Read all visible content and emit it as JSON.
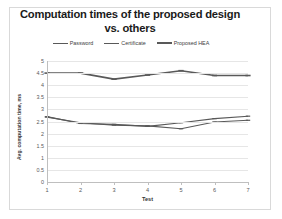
{
  "chart_data": {
    "type": "line",
    "title": "Computation times of the proposed design vs. others",
    "title_line1": "Computation times of the proposed design",
    "title_line2": "vs. others",
    "xlabel": "Test",
    "ylabel": "Avg. computation time, ms",
    "x": [
      1,
      2,
      3,
      4,
      5,
      6,
      7
    ],
    "categories": [
      "1",
      "2",
      "3",
      "4",
      "5",
      "6",
      "7"
    ],
    "xticklabels": [
      "1",
      "2",
      "3",
      "4",
      "5",
      "6",
      "7"
    ],
    "yticklabels": [
      "0",
      "0.5",
      "1",
      "1.5",
      "2",
      "2.5",
      "3",
      "3.5",
      "4",
      "4.5",
      "5"
    ],
    "ytickvalues": [
      0,
      0.5,
      1,
      1.5,
      2,
      2.5,
      3,
      3.5,
      4,
      4.5,
      5
    ],
    "ylim": [
      0,
      5
    ],
    "xlim": [
      1,
      7
    ],
    "grid": "horizontal",
    "legend_position": "top-center",
    "series": [
      {
        "name": "Password",
        "color": "#595959",
        "marker": "dash",
        "line_width": 1.1,
        "values": [
          2.68,
          2.45,
          2.35,
          2.32,
          2.2,
          2.48,
          2.55
        ]
      },
      {
        "name": "Certificate",
        "color": "#595959",
        "marker": "dash",
        "line_width": 1.1,
        "values": [
          2.7,
          2.42,
          2.38,
          2.3,
          2.45,
          2.62,
          2.72
        ]
      },
      {
        "name": "Proposed HEA",
        "color": "#595959",
        "marker": "dash",
        "line_width": 1.6,
        "values": [
          4.5,
          4.5,
          4.25,
          4.42,
          4.6,
          4.4,
          4.4
        ]
      }
    ]
  },
  "colors": {
    "grid": "#e6e6e6",
    "axis": "#bfbfbf",
    "line": "#595959",
    "text": "#404040",
    "frame": "#d9d9d9",
    "background": "#ffffff"
  }
}
